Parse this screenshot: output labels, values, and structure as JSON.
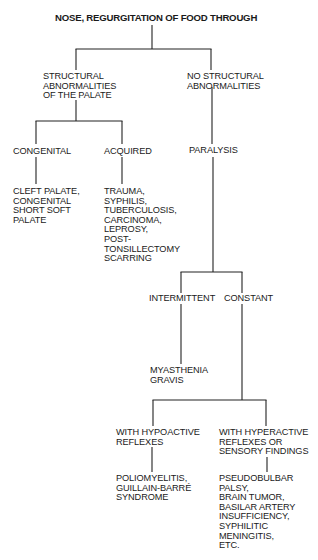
{
  "diagram": {
    "title": "NOSE, REGURGITATION OF FOOD THROUGH",
    "nodes": {
      "root": {
        "lines": [
          "NOSE, REGURGITATION OF FOOD THROUGH"
        ]
      },
      "structural": {
        "lines": [
          "STRUCTURAL",
          "ABNORMALITIES",
          "OF THE PALATE"
        ]
      },
      "no_structural": {
        "lines": [
          "NO STRUCTURAL",
          "ABNORMALITIES"
        ]
      },
      "congenital": {
        "lines": [
          "CONGENITAL"
        ]
      },
      "acquired": {
        "lines": [
          "ACQUIRED"
        ]
      },
      "paralysis": {
        "lines": [
          "PARALYSIS"
        ]
      },
      "congenital_causes": {
        "lines": [
          "CLEFT PALATE,",
          "CONGENITAL",
          "SHORT SOFT",
          "PALATE"
        ]
      },
      "acquired_causes": {
        "lines": [
          "TRAUMA,",
          "SYPHILIS,",
          "TUBERCULOSIS,",
          "CARCINOMA,",
          "LEPROSY,",
          "POST-",
          "TONSILLECTOMY",
          "SCARRING"
        ]
      },
      "intermittent": {
        "lines": [
          "INTERMITTENT"
        ]
      },
      "constant": {
        "lines": [
          "CONSTANT"
        ]
      },
      "myasthenia": {
        "lines": [
          "MYASTHENIA",
          "GRAVIS"
        ]
      },
      "hypoactive": {
        "lines": [
          "WITH HYPOACTIVE",
          "REFLEXES"
        ]
      },
      "hyperactive": {
        "lines": [
          "WITH HYPERACTIVE",
          "REFLEXES OR",
          "SENSORY FINDINGS"
        ]
      },
      "hypoactive_causes": {
        "lines": [
          "POLIOMYELITIS,",
          "GUILLAIN-BARRÉ",
          "SYNDROME"
        ]
      },
      "hyperactive_causes": {
        "lines": [
          "PSEUDOBULBAR",
          "PALSY,",
          "BRAIN TUMOR,",
          "BASILAR ARTERY",
          "INSUFFICIENCY,",
          "SYPHILITIC",
          "MENINGITIS,",
          "ETC."
        ]
      }
    },
    "edges": [
      [
        "root",
        "structural"
      ],
      [
        "root",
        "no_structural"
      ],
      [
        "structural",
        "congenital"
      ],
      [
        "structural",
        "acquired"
      ],
      [
        "no_structural",
        "paralysis"
      ],
      [
        "congenital",
        "congenital_causes"
      ],
      [
        "acquired",
        "acquired_causes"
      ],
      [
        "paralysis",
        "intermittent"
      ],
      [
        "paralysis",
        "constant"
      ],
      [
        "intermittent",
        "myasthenia"
      ],
      [
        "constant",
        "hypoactive"
      ],
      [
        "constant",
        "hyperactive"
      ],
      [
        "hypoactive",
        "hypoactive_causes"
      ],
      [
        "hyperactive",
        "hyperactive_causes"
      ]
    ]
  }
}
